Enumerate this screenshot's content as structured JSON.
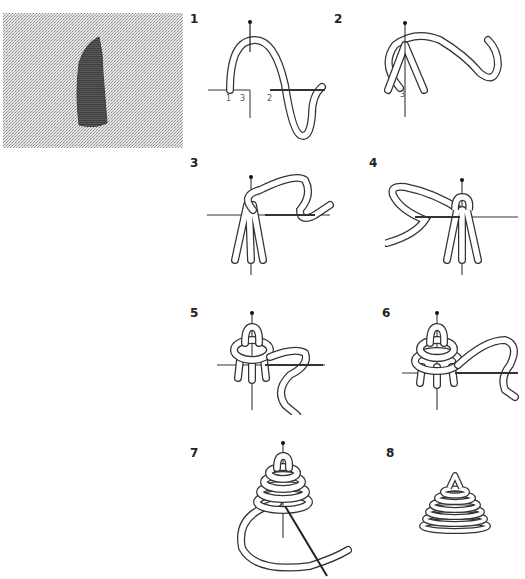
{
  "diagram": {
    "type": "stitch-instruction-sequence",
    "photo": {
      "description": "embroidered tapered shape on woven linen fabric",
      "fabric_color": "#c8c8c8",
      "stitch_color": "#555555"
    },
    "steps": [
      {
        "number": "1",
        "labels": [
          "1",
          "3",
          "2"
        ]
      },
      {
        "number": "2",
        "labels": [
          "3"
        ]
      },
      {
        "number": "3"
      },
      {
        "number": "4"
      },
      {
        "number": "5"
      },
      {
        "number": "6"
      },
      {
        "number": "7"
      },
      {
        "number": "8"
      }
    ],
    "colors": {
      "line": "#333333",
      "thread_fill": "#ffffff",
      "label": "#555555"
    }
  }
}
